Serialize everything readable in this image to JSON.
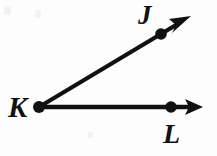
{
  "figure": {
    "background_color": "#fdfdfd",
    "ink_color": "#111111",
    "stroke_width": 4,
    "canvas": {
      "width": 217,
      "height": 156
    },
    "vertex": {
      "name": "K",
      "label": "K",
      "x": 39,
      "y": 107,
      "dot_radius": 5.5
    },
    "points": [
      {
        "name": "J",
        "label": "J",
        "x": 161,
        "y": 34,
        "dot_radius": 5.5,
        "label_x": 138,
        "label_y": 2
      },
      {
        "name": "L",
        "label": "L",
        "x": 171,
        "y": 107,
        "dot_radius": 5.5,
        "label_x": 163,
        "label_y": 120
      }
    ],
    "rays": [
      {
        "name": "ray-KJ",
        "from": "K",
        "through": "J",
        "start_x": 39,
        "start_y": 107,
        "end_x": 186,
        "end_y": 19,
        "angle_degrees": 31,
        "arrowhead": true
      },
      {
        "name": "ray-KL",
        "from": "K",
        "through": "L",
        "start_x": 39,
        "start_y": 107,
        "end_x": 198,
        "end_y": 107,
        "angle_degrees": 0,
        "arrowhead": true
      }
    ],
    "arrowheads": [
      {
        "name": "arrowhead-KJ",
        "tip_x": 191,
        "tip_y": 16,
        "length": 19,
        "half_width": 8
      },
      {
        "name": "arrowhead-KL",
        "tip_x": 203,
        "tip_y": 107,
        "length": 18,
        "half_width": 8
      }
    ]
  }
}
